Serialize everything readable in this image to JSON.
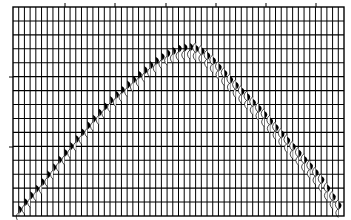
{
  "chart_data": {
    "type": "line",
    "title": "",
    "subtitle": "",
    "xlabel": "",
    "ylabel": "",
    "grid": true,
    "legend": null,
    "frame": {
      "left": 13,
      "top": 7,
      "right": 344,
      "bottom": 216
    },
    "trace_count": 59,
    "horizontal_grid_count": 15,
    "top_tick_x": [
      65,
      115,
      166,
      216,
      266,
      316
    ],
    "left_tick_y": [
      77,
      147
    ],
    "tick_labels": [],
    "event_curve_px": [
      [
        16,
        215
      ],
      [
        20,
        207
      ],
      [
        40,
        184
      ],
      [
        60,
        158
      ],
      [
        90,
        122
      ],
      [
        110,
        100
      ],
      [
        130,
        82
      ],
      [
        150,
        65
      ],
      [
        165,
        54
      ],
      [
        180,
        48
      ],
      [
        190,
        47
      ],
      [
        200,
        50
      ],
      [
        212,
        60
      ],
      [
        230,
        80
      ],
      [
        260,
        110
      ],
      [
        282,
        135
      ],
      [
        300,
        155
      ],
      [
        320,
        178
      ],
      [
        338,
        205
      ],
      [
        342,
        213
      ]
    ],
    "apex": {
      "x": 190,
      "y": 47
    },
    "colors": {
      "background": "#ffffff",
      "grid": "#000000",
      "fill": "#000000"
    }
  }
}
